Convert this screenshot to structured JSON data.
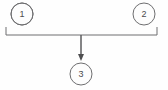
{
  "diagram": {
    "type": "flow-diagram",
    "background_color": "#fefefe",
    "stroke_color": "#6e6e70",
    "label_color": "#4a4a4c",
    "nodes": [
      {
        "id": "node-1",
        "label": "1",
        "shape": "circle",
        "cx": 22,
        "cy": 14,
        "r": 11
      },
      {
        "id": "node-2",
        "label": "2",
        "shape": "circle",
        "cx": 144,
        "cy": 14,
        "r": 11
      },
      {
        "id": "node-3",
        "label": "3",
        "shape": "circle",
        "cx": 81,
        "cy": 74,
        "r": 11
      }
    ],
    "bracket": {
      "left_x": 6,
      "right_x": 157,
      "line_y": 35,
      "tick_top_y": 27,
      "path": "M 6 27 L 6 35 L 157 35 L 157 27"
    },
    "arrow": {
      "from_x": 81,
      "from_y": 35,
      "to_x": 81,
      "to_y": 60,
      "head_points": "78,54 84,54 81,61",
      "direction": "down"
    }
  }
}
